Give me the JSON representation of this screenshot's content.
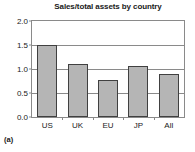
{
  "chart_data": {
    "type": "bar",
    "title": "Sales/total assets by country",
    "xlabel": "",
    "ylabel": "",
    "categories": [
      "US",
      "UK",
      "EU",
      "JP",
      "All"
    ],
    "values": [
      1.51,
      1.11,
      0.78,
      1.06,
      0.9
    ],
    "ylim": [
      0.0,
      2.0
    ],
    "yticks": [
      "0.0",
      "0.5",
      "1.0",
      "1.5",
      "2.0"
    ],
    "ytick_values": [
      0.0,
      0.5,
      1.0,
      1.5,
      2.0
    ],
    "grid": true,
    "legend": false,
    "bar_fill": "#b5b5b5",
    "bar_edge": "#404040",
    "axis_color": "#8a8a8a"
  },
  "panel_label": "(a)"
}
